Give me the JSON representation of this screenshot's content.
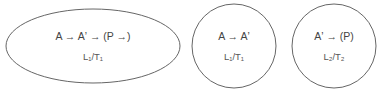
{
  "diagram": {
    "nodes": [
      {
        "id": "node-1",
        "shape": "ellipse",
        "expression": "A → Aʼ  → (P →)",
        "condition": "L₁/T₁"
      },
      {
        "id": "node-2",
        "shape": "circle",
        "expression": "A → Aʼ",
        "condition": "L₁/T₁"
      },
      {
        "id": "node-3",
        "shape": "circle",
        "expression": "Aʼ  → (P)",
        "condition": "L₂/T₂"
      }
    ]
  }
}
